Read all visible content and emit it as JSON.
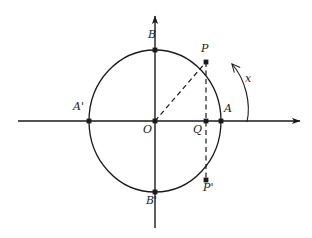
{
  "figure": {
    "kind": "unit-circle-trigonometry-diagram",
    "background_color": "#ffffff",
    "stroke_color": "#1a1a1a",
    "labels": {
      "origin": "O",
      "point_a": "A",
      "point_a_prime": "A'",
      "point_b": "B",
      "point_b_prime": "B'",
      "point_p": "P",
      "point_p_prime": "P'",
      "point_q": "Q",
      "arc_measure": "x"
    }
  },
  "geometry": {
    "center": {
      "x": 155,
      "y": 121
    },
    "radius_x": 66,
    "radius_y": 71,
    "x_axis": {
      "x1": 18,
      "y1": 121,
      "x2": 302,
      "y2": 121
    },
    "y_axis": {
      "x1": 155,
      "y1": 228,
      "x2": 155,
      "y2": 14
    },
    "points": {
      "O": {
        "x": 155,
        "y": 121
      },
      "A": {
        "x": 221,
        "y": 121
      },
      "A_prime": {
        "x": 89,
        "y": 121
      },
      "B": {
        "x": 155,
        "y": 50
      },
      "B_prime": {
        "x": 155,
        "y": 192
      },
      "P": {
        "x": 206,
        "y": 62
      },
      "P_prime": {
        "x": 206,
        "y": 180
      },
      "Q": {
        "x": 206,
        "y": 121
      }
    },
    "label_positions": {
      "O": {
        "x": 143,
        "y": 124
      },
      "A": {
        "x": 224,
        "y": 104
      },
      "A_prime": {
        "x": 74,
        "y": 102
      },
      "B": {
        "x": 148,
        "y": 30
      },
      "B_prime": {
        "x": 147,
        "y": 196
      },
      "P": {
        "x": 201,
        "y": 44
      },
      "P_prime": {
        "x": 203,
        "y": 183
      },
      "Q": {
        "x": 194,
        "y": 124
      },
      "x": {
        "x": 245,
        "y": 74
      }
    },
    "dashed_segments": [
      {
        "from": "O",
        "to": "P"
      },
      {
        "from": "P",
        "to": "P_prime"
      }
    ],
    "arc_x": {
      "start": {
        "x": 247,
        "y": 121
      },
      "end": {
        "x": 231,
        "y": 64
      },
      "control": {
        "x": 250,
        "y": 86
      }
    }
  }
}
